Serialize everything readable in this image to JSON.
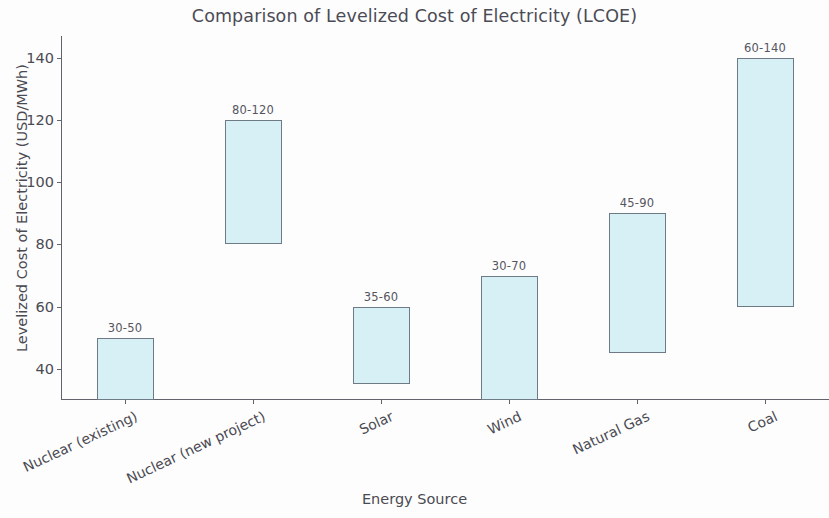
{
  "chart_data": {
    "type": "bar",
    "bar_style": "floating-range",
    "title": "Comparison of Levelized Cost of Electricity (LCOE)",
    "subtitle": "",
    "xlabel": "Energy Source",
    "ylabel": "Levelized Cost of Electricity (USD/MWh)",
    "categories": [
      "Nuclear (existing)",
      "Nuclear (new project)",
      "Solar",
      "Wind",
      "Natural Gas",
      "Coal"
    ],
    "series": [
      {
        "name": "low",
        "values": [
          30,
          80,
          35,
          30,
          45,
          60
        ]
      },
      {
        "name": "high",
        "values": [
          50,
          120,
          60,
          70,
          90,
          140
        ]
      }
    ],
    "data_labels": [
      "30-50",
      "80-120",
      "35-60",
      "30-70",
      "45-90",
      "60-140"
    ],
    "ylim": [
      30,
      147
    ],
    "yticks": [
      40,
      60,
      80,
      100,
      120,
      140
    ],
    "ytick_labels": [
      "40",
      "60",
      "80",
      "100",
      "120",
      "140"
    ],
    "grid": false,
    "legend": "none",
    "bar_fill_color": "#d7f0f6",
    "bar_edge_color": "#6e7b86",
    "axis_color": "#63636d",
    "text_color": "#4a4a52",
    "background_color": "#fdfdfd"
  }
}
